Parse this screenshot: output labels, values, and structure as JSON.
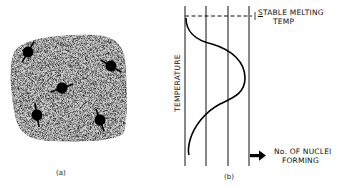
{
  "panel_a": {
    "caption": "(a)",
    "description": "Stippled region containing five dark nuclei with orientation arrows",
    "nuclei": [
      {
        "x": 28,
        "y": 52,
        "angle": -60
      },
      {
        "x": 111,
        "y": 66,
        "angle": 30
      },
      {
        "x": 62,
        "y": 88,
        "angle": -20
      },
      {
        "x": 37,
        "y": 115,
        "angle": 80
      },
      {
        "x": 100,
        "y": 120,
        "angle": 70
      }
    ]
  },
  "panel_b": {
    "caption": "(b)",
    "y_axis_label": "TEMPERATURE",
    "top_label_line1": "STABLE MELTING",
    "top_label_line2": "TEMP",
    "arrow_label_line1": "No. OF NUCLEI",
    "arrow_label_line2": "FORMING"
  }
}
